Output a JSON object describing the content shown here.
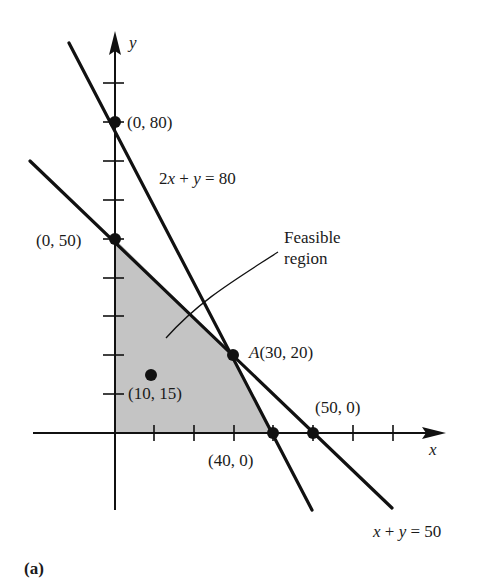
{
  "figure_label": "(a)",
  "axes": {
    "x_label": "x",
    "y_label": "y"
  },
  "lines": [
    {
      "equation_label": "2x + y = 80",
      "parts": [
        "2",
        "x",
        " + ",
        "y",
        " = 80"
      ]
    },
    {
      "equation_label": "x + y = 50",
      "parts": [
        "x",
        " + ",
        "y",
        " = 50"
      ]
    }
  ],
  "points": [
    {
      "label": "(0, 80)",
      "x": 0,
      "y": 80
    },
    {
      "label": "(0, 50)",
      "x": 0,
      "y": 50
    },
    {
      "label_prefix": "A",
      "label": "(30, 20)",
      "x": 30,
      "y": 20
    },
    {
      "label": "(10, 15)",
      "x": 10,
      "y": 15
    },
    {
      "label": "(40, 0)",
      "x": 40,
      "y": 0
    },
    {
      "label": "(50, 0)",
      "x": 50,
      "y": 0
    }
  ],
  "region": {
    "label_line1": "Feasible",
    "label_line2": "region",
    "fill_color": "#c8c8c8"
  },
  "colors": {
    "ink": "#111111",
    "background": "#ffffff"
  }
}
